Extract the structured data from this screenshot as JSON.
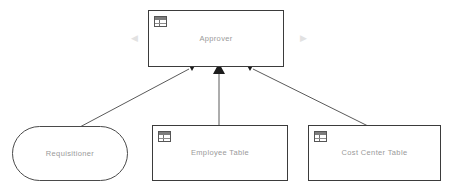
{
  "diagram": {
    "background_color": "#ffffff",
    "line_color": "#5a5a5a",
    "label_color": "#9a9a9a",
    "border_color": "#3b3b3b",
    "nodes": [
      {
        "id": "approver",
        "label": "Approver",
        "shape": "rectangle",
        "icon": "table-icon",
        "x": 148,
        "y": 10,
        "width": 136,
        "height": 57
      },
      {
        "id": "requisitioner",
        "label": "Requisitioner",
        "shape": "rounded-rectangle",
        "icon": "none",
        "x": 12,
        "y": 126,
        "width": 116,
        "height": 55
      },
      {
        "id": "employee_table",
        "label": "Employee Table",
        "shape": "rectangle",
        "icon": "table-icon",
        "x": 152,
        "y": 125,
        "width": 136,
        "height": 56
      },
      {
        "id": "cost_center_table",
        "label": "Cost Center Table",
        "shape": "rectangle",
        "icon": "table-icon",
        "x": 308,
        "y": 125,
        "width": 133,
        "height": 56
      }
    ],
    "connectors": [
      {
        "id": "requisitioner-to-approver",
        "from": "requisitioner",
        "to": "approver",
        "arrowhead": "filled-triangle",
        "x1": 78,
        "y1": 128,
        "x2": 192,
        "y2": 67
      },
      {
        "id": "employee-table-to-approver",
        "from": "employee_table",
        "to": "approver",
        "arrowhead": "filled-triangle",
        "x1": 219,
        "y1": 125,
        "x2": 219,
        "y2": 67
      },
      {
        "id": "cost-center-table-to-approver",
        "from": "cost_center_table",
        "to": "approver",
        "arrowhead": "filled-triangle",
        "x1": 368,
        "y1": 126,
        "x2": 250,
        "y2": 67
      }
    ],
    "markers": {
      "chevron_left": "◀",
      "chevron_right": "▶"
    }
  }
}
